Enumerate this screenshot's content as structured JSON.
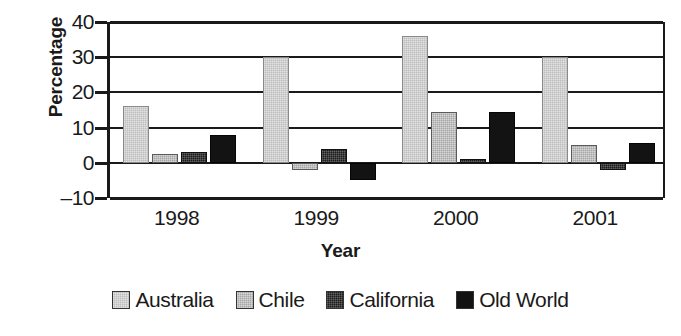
{
  "chart_data": {
    "type": "bar",
    "title": "",
    "xlabel": "Year",
    "ylabel": "Percentage",
    "categories": [
      "1998",
      "1999",
      "2000",
      "2001"
    ],
    "ylim": [
      -10,
      40
    ],
    "yticks": [
      40,
      30,
      20,
      10,
      0,
      -10
    ],
    "ytick_labels": [
      "40",
      "30",
      "20",
      "10",
      "0",
      "–10"
    ],
    "grid": true,
    "legend_position": "bottom",
    "series": [
      {
        "name": "Australia",
        "color": "#e2e2e2",
        "values": [
          16,
          30,
          36,
          30
        ]
      },
      {
        "name": "Chile",
        "color": "#a6a6a6",
        "values": [
          2.5,
          -2,
          14.5,
          5
        ]
      },
      {
        "name": "California",
        "color": "#1c1c1c",
        "values": [
          3,
          4,
          1,
          -2
        ]
      },
      {
        "name": "Old World",
        "color": "#131313",
        "values": [
          8,
          -5,
          14.5,
          5.5
        ]
      }
    ]
  }
}
